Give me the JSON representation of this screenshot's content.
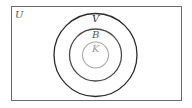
{
  "diagram": {
    "type": "venn-nested-sets",
    "universe": {
      "label": "U",
      "stroke": "#6a6a6a"
    },
    "sets": [
      {
        "label": "V",
        "stroke": "#2a2a2a",
        "cx": 95.5,
        "cy": 55,
        "r": 41.5,
        "label_y": 21
      },
      {
        "label": "B",
        "stroke": "#4a4a4a",
        "cx": 95.5,
        "cy": 55,
        "r": 26,
        "label_y": 38
      },
      {
        "label": "K",
        "stroke": "#a8a8a8",
        "cx": 95.5,
        "cy": 55,
        "r": 13,
        "label_y": 51
      }
    ],
    "relations": "K ⊂ B ⊂ V ⊂ U"
  }
}
